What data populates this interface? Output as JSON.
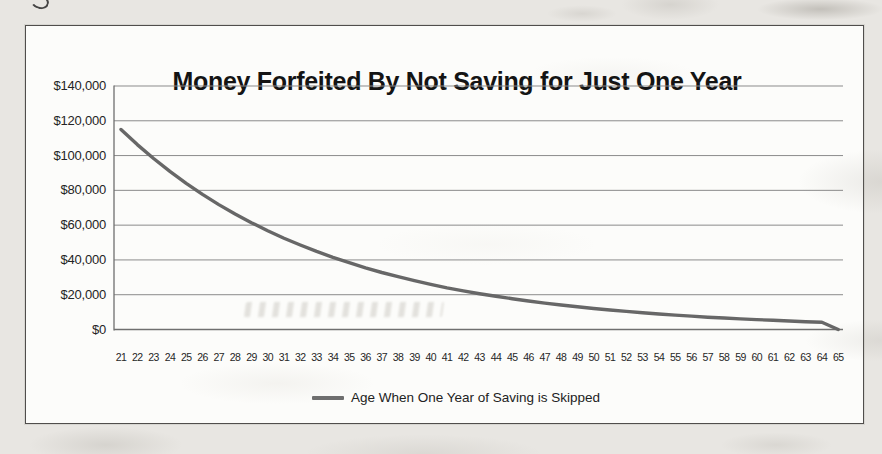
{
  "chart_data": {
    "type": "line",
    "title": "Money Forfeited By Not Saving for Just One Year",
    "categories": [
      21,
      22,
      23,
      24,
      25,
      26,
      27,
      28,
      29,
      30,
      31,
      32,
      33,
      34,
      35,
      36,
      37,
      38,
      39,
      40,
      41,
      42,
      43,
      44,
      45,
      46,
      47,
      48,
      49,
      50,
      51,
      52,
      53,
      54,
      55,
      56,
      57,
      58,
      59,
      60,
      61,
      62,
      63,
      64,
      65
    ],
    "series": [
      {
        "name": "Age When One Year of Saving is Skipped",
        "values": [
          115000,
          106300,
          98300,
          90900,
          84000,
          77700,
          71800,
          66400,
          61400,
          56800,
          52500,
          48600,
          44900,
          41500,
          38400,
          35500,
          32800,
          30400,
          28100,
          26000,
          24000,
          22200,
          20600,
          19100,
          17700,
          16400,
          15200,
          14100,
          13100,
          12100,
          11200,
          10400,
          9600,
          8900,
          8300,
          7700,
          7100,
          6600,
          6100,
          5700,
          5300,
          4900,
          4500,
          4200,
          0
        ]
      }
    ],
    "xlabel": "",
    "ylabel": "",
    "ylim": [
      0,
      140000
    ],
    "y_tick_interval": 20000,
    "y_tick_labels_top_to_bottom": [
      "$140,000",
      "$120,000",
      "$100,000",
      "$80,000",
      "$60,000",
      "$40,000",
      "$20,000",
      "$0"
    ],
    "grid": "horizontal",
    "legend_position": "bottom",
    "line_color": "#676767",
    "gridline_color": "#8b8b8b",
    "axis_color": "#6f6f6f"
  }
}
